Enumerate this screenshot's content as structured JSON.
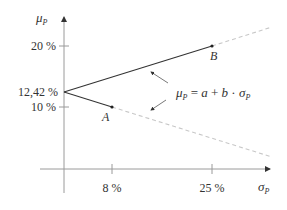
{
  "diagram": {
    "y_axis": {
      "label_main": "μ",
      "label_sub": "P",
      "ticks": [
        {
          "label": "20 %",
          "value": 20
        },
        {
          "label": "12,42 %",
          "value": 12.42
        },
        {
          "label": "10 %",
          "value": 10
        }
      ]
    },
    "x_axis": {
      "label_main": "σ",
      "label_sub": "P",
      "ticks": [
        {
          "label": "8 %",
          "value": 8
        },
        {
          "label": "25 %",
          "value": 25
        }
      ]
    },
    "points": [
      {
        "name": "A",
        "sigma": 8,
        "mu": 10
      },
      {
        "name": "B",
        "sigma": 25,
        "mu": 20
      }
    ],
    "intercept_label": "12,42 %",
    "formula": {
      "lhs_main": "μ",
      "lhs_sub": "P",
      "eq": " = ",
      "a": "a",
      "plus": " + ",
      "b": "b",
      "dot": " · ",
      "rhs_main": "σ",
      "rhs_sub": "P"
    },
    "colors": {
      "axis": "#9a9a9a",
      "line": "#333333",
      "dashed": "#c8c8c8",
      "text": "#333333"
    }
  }
}
